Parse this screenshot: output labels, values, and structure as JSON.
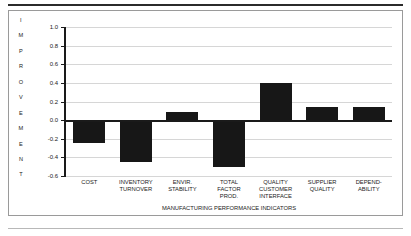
{
  "chart_data": {
    "type": "bar",
    "title": "",
    "xlabel": "MANUFACTURING PERFORMANCE INDICATORS",
    "ylabel": "IMPROVEMENT",
    "ylabel_letters": [
      "I",
      "M",
      "P",
      "R",
      "O",
      "V",
      "E",
      "M",
      "E",
      "N",
      "T"
    ],
    "categories": [
      "COST",
      "INVENTORY TURNOVER",
      "ENVIR. STABILITY",
      "TOTAL FACTOR PROD.",
      "QUALITY CUSTOMER INTERFACE",
      "SUPPLIER QUALITY",
      "DEPEND-ABILITY"
    ],
    "category_lines": [
      [
        "COST"
      ],
      [
        "INVENTORY",
        "TURNOVER"
      ],
      [
        "ENVIR.",
        "STABILITY"
      ],
      [
        "TOTAL",
        "FACTOR",
        "PROD."
      ],
      [
        "QUALITY",
        "CUSTOMER",
        "INTERFACE"
      ],
      [
        "SUPPLIER",
        "QUALITY"
      ],
      [
        "DEPEND-",
        "ABILITY"
      ]
    ],
    "values": [
      -0.25,
      -0.45,
      0.09,
      -0.5,
      0.4,
      0.14,
      0.14
    ],
    "ylim": [
      -0.6,
      1.0
    ],
    "yticks": [
      1.0,
      0.8,
      0.6,
      0.4,
      0.2,
      0.0,
      -0.2,
      -0.4,
      -0.6
    ],
    "ytick_labels": [
      "1.0",
      "0.8",
      "0.6",
      "0.4",
      "0.2",
      "0.0",
      "-0.2",
      "-0.4",
      "-0.6"
    ],
    "grid": true,
    "legend": false,
    "bar_color": "#171717",
    "gridline_color": "#d6d6d6",
    "axis_color": "#1a1a1a"
  }
}
